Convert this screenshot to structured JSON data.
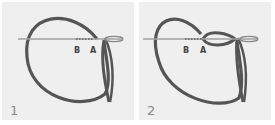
{
  "steps": [
    {
      "number": "1",
      "label_b": "B",
      "label_a": "A"
    },
    {
      "number": "2",
      "label_b": "B",
      "label_a": "A"
    }
  ],
  "colors": {
    "panel_bg": "#efefef",
    "thread": "#555555",
    "needle": "#9a9a9a",
    "text": "#444444",
    "step_text": "#8a8a8a"
  }
}
